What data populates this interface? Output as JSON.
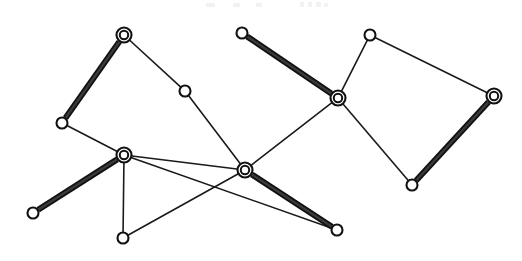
{
  "figure": {
    "kind": "graph-matching-diagram",
    "width": 522,
    "height": 261,
    "background_color": "#ffffff",
    "ink_color": "#111111",
    "thin_edge_color": "#1a1a1a",
    "thick_edge_color": "#111111",
    "node_fill": "#ffffff",
    "plain_node_radius": 5.5,
    "matched_node_outer_radius": 7.5,
    "matched_node_inner_radius": 4.2,
    "counts": {
      "nodes": 14,
      "matched_nodes": 6,
      "plain_nodes": 8,
      "edges": 17,
      "thick_edges": 7,
      "thin_edges": 10
    }
  },
  "nodes": [
    {
      "id": "n1",
      "label": "",
      "x": 124,
      "y": 35,
      "type": "matched"
    },
    {
      "id": "n2",
      "label": "",
      "x": 185,
      "y": 91,
      "type": "plain"
    },
    {
      "id": "n3",
      "label": "",
      "x": 62,
      "y": 123,
      "type": "plain"
    },
    {
      "id": "n4",
      "label": "",
      "x": 124,
      "y": 155,
      "type": "matched"
    },
    {
      "id": "n5",
      "label": "",
      "x": 33,
      "y": 213,
      "type": "plain"
    },
    {
      "id": "n6",
      "label": "",
      "x": 123,
      "y": 238,
      "type": "plain"
    },
    {
      "id": "n7",
      "label": "",
      "x": 245,
      "y": 170,
      "type": "matched"
    },
    {
      "id": "n8",
      "label": "",
      "x": 337,
      "y": 230,
      "type": "plain"
    },
    {
      "id": "n9",
      "label": "",
      "x": 242,
      "y": 33,
      "type": "plain"
    },
    {
      "id": "n10",
      "label": "",
      "x": 338,
      "y": 98,
      "type": "matched"
    },
    {
      "id": "n11",
      "label": "",
      "x": 370,
      "y": 35,
      "type": "plain"
    },
    {
      "id": "n12",
      "label": "",
      "x": 494,
      "y": 96,
      "type": "matched"
    },
    {
      "id": "n13",
      "label": "",
      "x": 412,
      "y": 185,
      "type": "plain"
    },
    {
      "id": "n14",
      "label": "",
      "x": 0,
      "y": 0,
      "type": "unused"
    }
  ],
  "edges": [
    {
      "id": "e1",
      "from": "n1",
      "to": "n3",
      "style": "thick"
    },
    {
      "id": "e2",
      "from": "n1",
      "to": "n2",
      "style": "thin"
    },
    {
      "id": "e3",
      "from": "n2",
      "to": "n7",
      "style": "thin"
    },
    {
      "id": "e4",
      "from": "n3",
      "to": "n4",
      "style": "thin"
    },
    {
      "id": "e5",
      "from": "n4",
      "to": "n5",
      "style": "thick"
    },
    {
      "id": "e6",
      "from": "n4",
      "to": "n6",
      "style": "thin"
    },
    {
      "id": "e7",
      "from": "n4",
      "to": "n8",
      "style": "thin"
    },
    {
      "id": "e8",
      "from": "n6",
      "to": "n7",
      "style": "thin"
    },
    {
      "id": "e9",
      "from": "n7",
      "to": "n8",
      "style": "thick"
    },
    {
      "id": "e10",
      "from": "n7",
      "to": "n10",
      "style": "thin"
    },
    {
      "id": "e11",
      "from": "n9",
      "to": "n10",
      "style": "thick"
    },
    {
      "id": "e12",
      "from": "n10",
      "to": "n11",
      "style": "thin"
    },
    {
      "id": "e13",
      "from": "n10",
      "to": "n13",
      "style": "thin"
    },
    {
      "id": "e14",
      "from": "n11",
      "to": "n12",
      "style": "thin"
    },
    {
      "id": "e15",
      "from": "n12",
      "to": "n13",
      "style": "thick"
    },
    {
      "id": "e16",
      "from": "n2",
      "to": "n1",
      "style": "none"
    },
    {
      "id": "e17",
      "from": "n4",
      "to": "n7",
      "style": "thin"
    }
  ],
  "legend": {
    "matched_node_name": "matched-vertex",
    "plain_node_name": "vertex",
    "thick_edge_name": "matching-edge",
    "thin_edge_name": "graph-edge"
  }
}
